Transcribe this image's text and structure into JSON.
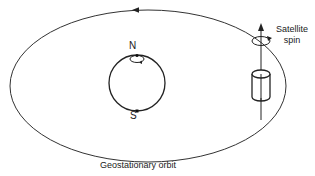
{
  "figure": {
    "type": "diagram",
    "labels": {
      "north": "N",
      "south": "S",
      "satellite_spin_line1": "Satellite",
      "satellite_spin_line2": "spin",
      "orbit": "Geostationary orbit"
    },
    "elements": [
      {
        "name": "orbit-ellipse",
        "description": "Large ellipse representing the geostationary orbit, with direction arrow at the top"
      },
      {
        "name": "earth-circle",
        "description": "Circle representing Earth with N and S poles marked"
      },
      {
        "name": "earth-rotation-arrow",
        "description": "Small loop near the north pole indicating Earth rotation"
      },
      {
        "name": "satellite-cylinder",
        "description": "Cylindrical spin-stabilized satellite on the right of the orbit"
      },
      {
        "name": "spin-axis-arrow",
        "description": "Vertical arrow through the satellite indicating spin axis"
      },
      {
        "name": "spin-direction-arrow",
        "description": "Curved loop arrow around the spin axis"
      }
    ],
    "colors": {
      "stroke": "#1a1a1a",
      "background": "#ffffff"
    }
  }
}
